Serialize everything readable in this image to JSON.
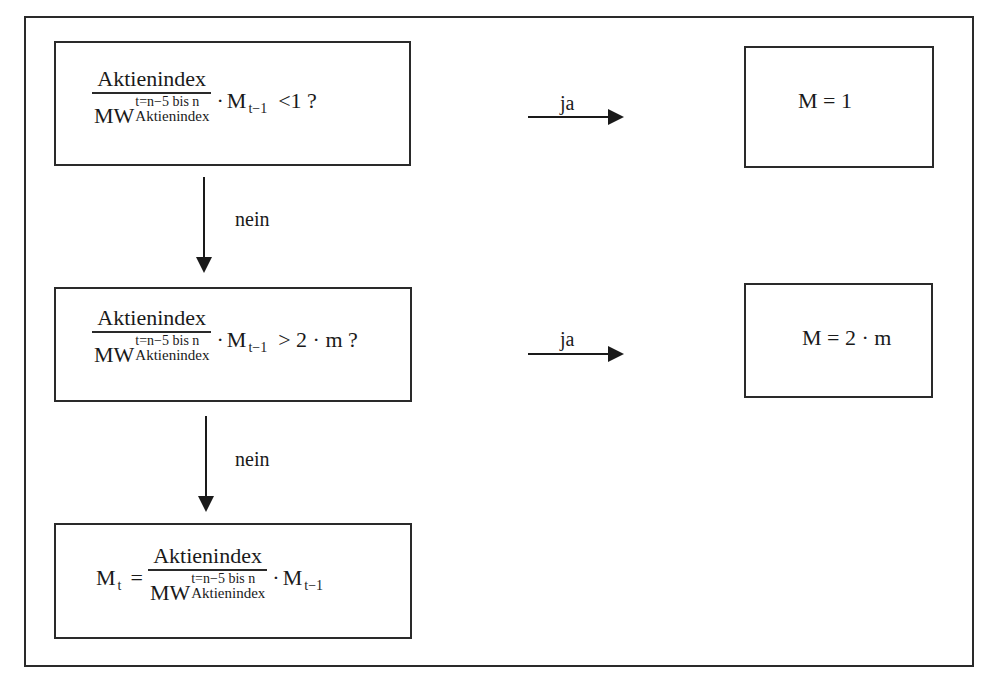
{
  "diagram": {
    "type": "flowchart",
    "decision1": {
      "numerator": "Aktienindex",
      "denominator_base": "MW",
      "denominator_sup": "t=n−5 bis n",
      "denominator_sub": "Aktienindex",
      "dot": "·",
      "factor": "M",
      "factor_sub": "t−1",
      "comparison": "<1 ?"
    },
    "decision2": {
      "numerator": "Aktienindex",
      "denominator_base": "MW",
      "denominator_sup": "t=n−5 bis n",
      "denominator_sub": "Aktienindex",
      "dot": "·",
      "factor": "M",
      "factor_sub": "t−1",
      "comparison": "> 2 · m  ?"
    },
    "process": {
      "lhs": "M",
      "lhs_sub": "t",
      "equals": "=",
      "numerator": "Aktienindex",
      "denominator_base": "MW",
      "denominator_sup": "t=n−5 bis n",
      "denominator_sub": "Aktienindex",
      "dot": "·",
      "factor": "M",
      "factor_sub": "t−1"
    },
    "result1": {
      "text": "M = 1"
    },
    "result2": {
      "text": "M = 2 · m"
    },
    "edges": [
      {
        "from": "decision1",
        "to": "result1",
        "label": "ja"
      },
      {
        "from": "decision1",
        "to": "decision2",
        "label": "nein"
      },
      {
        "from": "decision2",
        "to": "result2",
        "label": "ja"
      },
      {
        "from": "decision2",
        "to": "process",
        "label": "nein"
      }
    ]
  }
}
